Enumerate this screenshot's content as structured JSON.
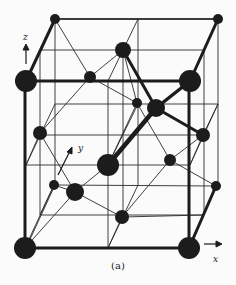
{
  "figure": {
    "caption": "(a)",
    "axes": {
      "x": "x",
      "y": "y",
      "z": "z"
    },
    "colors": {
      "atom": "#1c1c1c",
      "bond": "#1c1c1c",
      "cell": "#2a2a2a",
      "background": "#fbfbfb"
    }
  },
  "diagram": {
    "type": "crystal-structure",
    "atoms": [
      {
        "id": "a1",
        "x": 25,
        "y": 248,
        "r": 11
      },
      {
        "id": "a2",
        "x": 189,
        "y": 248,
        "r": 11
      },
      {
        "id": "a3",
        "x": 26,
        "y": 81,
        "r": 11
      },
      {
        "id": "a4",
        "x": 190,
        "y": 81,
        "r": 11
      },
      {
        "id": "a5",
        "x": 55,
        "y": 19,
        "r": 5
      },
      {
        "id": "a6",
        "x": 218,
        "y": 19,
        "r": 5
      },
      {
        "id": "a7",
        "x": 123,
        "y": 50,
        "r": 8
      },
      {
        "id": "a8",
        "x": 90,
        "y": 77,
        "r": 6
      },
      {
        "id": "a9",
        "x": 156,
        "y": 108,
        "r": 9
      },
      {
        "id": "a10",
        "x": 137,
        "y": 103,
        "r": 5
      },
      {
        "id": "a11",
        "x": 40,
        "y": 133,
        "r": 7
      },
      {
        "id": "a12",
        "x": 203,
        "y": 135,
        "r": 7
      },
      {
        "id": "a13",
        "x": 108,
        "y": 165,
        "r": 11
      },
      {
        "id": "a14",
        "x": 170,
        "y": 160,
        "r": 6
      },
      {
        "id": "a15",
        "x": 54,
        "y": 185,
        "r": 5
      },
      {
        "id": "a16",
        "x": 75,
        "y": 192,
        "r": 9
      },
      {
        "id": "a17",
        "x": 216,
        "y": 186,
        "r": 5
      },
      {
        "id": "a18",
        "x": 122,
        "y": 217,
        "r": 7
      }
    ]
  }
}
